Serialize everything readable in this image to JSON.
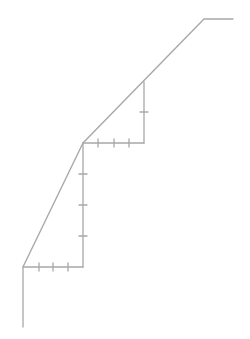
{
  "diagram": {
    "stroke_color": "#a8a8a8",
    "stroke_width": 1.3,
    "tick_half_length": 4,
    "main_path": [
      [
        23,
        327
      ],
      [
        23,
        267
      ],
      [
        83,
        143
      ],
      [
        204,
        19
      ],
      [
        233,
        19
      ]
    ],
    "steps": [
      {
        "name": "lower-step",
        "horizontal": {
          "from": [
            23,
            267
          ],
          "to": [
            83,
            267
          ],
          "ticks_x": [
            39,
            53,
            68
          ]
        },
        "vertical": {
          "from": [
            83,
            267
          ],
          "to": [
            83,
            143
          ],
          "ticks_y": [
            174,
            205,
            236
          ]
        }
      },
      {
        "name": "upper-step",
        "horizontal": {
          "from": [
            83,
            143
          ],
          "to": [
            144,
            143
          ],
          "ticks_x": [
            98,
            114,
            129
          ]
        },
        "vertical": {
          "from": [
            144,
            143
          ],
          "to": [
            144,
            82
          ],
          "ticks_y": [
            112
          ]
        }
      }
    ]
  }
}
